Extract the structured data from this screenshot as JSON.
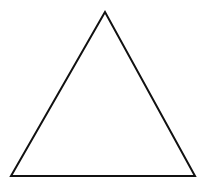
{
  "canvas": {
    "width": 208,
    "height": 190,
    "background": "#ffffff"
  },
  "shape": {
    "type": "triangle",
    "points": "105,12 11,176 195,176",
    "stroke": "#111111",
    "stroke_width": "2",
    "fill": "none"
  }
}
